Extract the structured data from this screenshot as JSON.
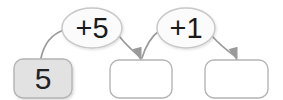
{
  "diagram": {
    "type": "counting-on-number-bonds",
    "canvas": {
      "width": 283,
      "height": 100,
      "background": "#ffffff"
    },
    "colors": {
      "box_stroke": "#b0b0b0",
      "box_fill_empty": "#ffffff",
      "box_fill_start": "#e2e2e2",
      "oval_stroke": "#c8c8c8",
      "oval_fill": "#fbfbfb",
      "arrow_stroke": "#9a9a9a",
      "text": "#222222"
    },
    "boxes": [
      {
        "id": "box-start",
        "value": "5",
        "filled": true,
        "x": 14,
        "y": 59,
        "width": 58,
        "height": 39
      },
      {
        "id": "box-middle",
        "value": "",
        "filled": false,
        "x": 110,
        "y": 60,
        "width": 62,
        "height": 38
      },
      {
        "id": "box-end",
        "value": "",
        "filled": false,
        "x": 205,
        "y": 60,
        "width": 63,
        "height": 38
      }
    ],
    "operations": [
      {
        "id": "op-add-5",
        "label": "+5",
        "cx": 92,
        "cy": 28,
        "rx": 30,
        "ry": 20
      },
      {
        "id": "op-add-1",
        "label": "+1",
        "cx": 186,
        "cy": 28,
        "rx": 29,
        "ry": 20
      }
    ],
    "arrows": [
      {
        "id": "arrow-1",
        "from": "box-start",
        "to": "op-add-5",
        "arrowhead": false
      },
      {
        "id": "arrow-2",
        "from": "op-add-5",
        "to": "box-middle",
        "arrowhead": true
      },
      {
        "id": "arrow-3",
        "from": "box-middle",
        "to": "op-add-1",
        "arrowhead": false
      },
      {
        "id": "arrow-4",
        "from": "op-add-1",
        "to": "box-end",
        "arrowhead": true
      }
    ]
  }
}
